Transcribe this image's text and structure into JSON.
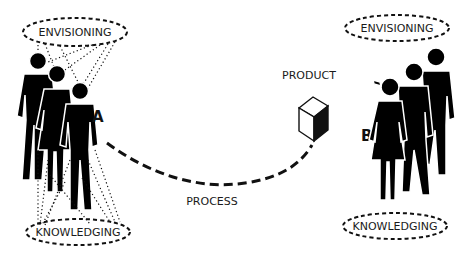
{
  "diagram": {
    "group_a": {
      "label": "A",
      "top_bubble": "ENVISIONING",
      "bottom_bubble": "KNOWLEDGING"
    },
    "group_b": {
      "label": "B",
      "top_bubble": "ENVISIONING",
      "bottom_bubble": "KNOWLEDGING"
    },
    "product_label": "PRODUCT",
    "process_label": "PROCESS",
    "icons": {
      "product": "cube-icon",
      "people": "person-silhouette-icon"
    },
    "colors": {
      "ink": "#000000",
      "background": "#ffffff"
    }
  }
}
